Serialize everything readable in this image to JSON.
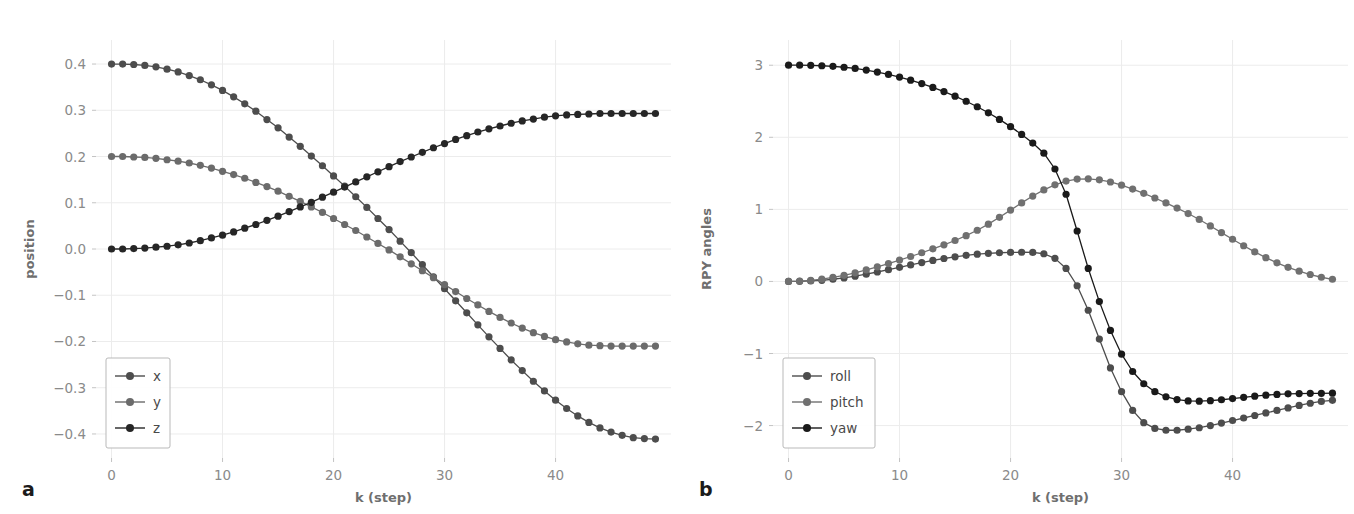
{
  "figure": {
    "panel_a_label": "a",
    "panel_b_label": "b",
    "background": "#ffffff",
    "grid_color": "#ececec"
  },
  "chart_data": [
    {
      "type": "line",
      "panel": "a",
      "title": "",
      "xlabel": "k (step)",
      "ylabel": "position",
      "xlim": [
        -1.4,
        50.4
      ],
      "ylim": [
        -0.452,
        0.452
      ],
      "xticks": [
        0,
        10,
        20,
        30,
        40
      ],
      "yticks": [
        -0.4,
        -0.3,
        -0.2,
        -0.1,
        0.0,
        0.1,
        0.2,
        0.3,
        0.4
      ],
      "xticklabels": [
        "0",
        "10",
        "20",
        "30",
        "40"
      ],
      "yticklabels": [
        "−0.4",
        "−0.3",
        "−0.2",
        "−0.1",
        "0.0",
        "0.1",
        "0.2",
        "0.3",
        "0.4"
      ],
      "grid": true,
      "legend_position": "lower left",
      "markers": "circle",
      "x": [
        0,
        1,
        2,
        3,
        4,
        5,
        6,
        7,
        8,
        9,
        10,
        11,
        12,
        13,
        14,
        15,
        16,
        17,
        18,
        19,
        20,
        21,
        22,
        23,
        24,
        25,
        26,
        27,
        28,
        29,
        30,
        31,
        32,
        33,
        34,
        35,
        36,
        37,
        38,
        39,
        40,
        41,
        42,
        43,
        44,
        45,
        46,
        47,
        48,
        49
      ],
      "series": [
        {
          "name": "x",
          "color": "#4d4d4d",
          "values": [
            0.4,
            0.4,
            0.399,
            0.397,
            0.394,
            0.389,
            0.383,
            0.375,
            0.366,
            0.355,
            0.343,
            0.329,
            0.314,
            0.298,
            0.28,
            0.262,
            0.242,
            0.222,
            0.201,
            0.18,
            0.158,
            0.136,
            0.113,
            0.09,
            0.066,
            0.042,
            0.017,
            -0.008,
            -0.034,
            -0.06,
            -0.086,
            -0.112,
            -0.138,
            -0.164,
            -0.19,
            -0.215,
            -0.24,
            -0.263,
            -0.286,
            -0.307,
            -0.327,
            -0.345,
            -0.361,
            -0.375,
            -0.387,
            -0.396,
            -0.403,
            -0.408,
            -0.41,
            -0.411
          ]
        },
        {
          "name": "y",
          "color": "#6b6b6b",
          "values": [
            0.2,
            0.2,
            0.199,
            0.198,
            0.196,
            0.193,
            0.19,
            0.186,
            0.181,
            0.175,
            0.168,
            0.161,
            0.153,
            0.144,
            0.135,
            0.125,
            0.114,
            0.103,
            0.091,
            0.079,
            0.066,
            0.053,
            0.04,
            0.026,
            0.012,
            -0.002,
            -0.017,
            -0.032,
            -0.047,
            -0.062,
            -0.077,
            -0.092,
            -0.107,
            -0.121,
            -0.135,
            -0.148,
            -0.16,
            -0.171,
            -0.181,
            -0.189,
            -0.196,
            -0.201,
            -0.205,
            -0.208,
            -0.209,
            -0.21,
            -0.21,
            -0.21,
            -0.21,
            -0.21
          ]
        },
        {
          "name": "z",
          "color": "#262626",
          "values": [
            0.0,
            0.0,
            0.001,
            0.002,
            0.004,
            0.006,
            0.009,
            0.013,
            0.018,
            0.024,
            0.03,
            0.037,
            0.045,
            0.053,
            0.062,
            0.071,
            0.081,
            0.091,
            0.101,
            0.112,
            0.123,
            0.134,
            0.145,
            0.156,
            0.167,
            0.178,
            0.189,
            0.199,
            0.209,
            0.219,
            0.228,
            0.237,
            0.245,
            0.253,
            0.26,
            0.266,
            0.272,
            0.277,
            0.281,
            0.285,
            0.288,
            0.29,
            0.291,
            0.292,
            0.293,
            0.293,
            0.293,
            0.293,
            0.293,
            0.293
          ]
        }
      ],
      "legend": [
        "x",
        "y",
        "z"
      ]
    },
    {
      "type": "line",
      "panel": "b",
      "title": "",
      "xlabel": "k (step)",
      "ylabel": "RPY angles",
      "xlim": [
        -1.4,
        50.4
      ],
      "ylim": [
        -2.45,
        3.35
      ],
      "xticks": [
        0,
        10,
        20,
        30,
        40
      ],
      "yticks": [
        -2,
        -1,
        0,
        1,
        2,
        3
      ],
      "xticklabels": [
        "0",
        "10",
        "20",
        "30",
        "40"
      ],
      "yticklabels": [
        "−2",
        "−1",
        "0",
        "1",
        "2",
        "3"
      ],
      "grid": true,
      "legend_position": "lower left",
      "markers": "circle",
      "x": [
        0,
        1,
        2,
        3,
        4,
        5,
        6,
        7,
        8,
        9,
        10,
        11,
        12,
        13,
        14,
        15,
        16,
        17,
        18,
        19,
        20,
        21,
        22,
        23,
        24,
        25,
        26,
        27,
        28,
        29,
        30,
        31,
        32,
        33,
        34,
        35,
        36,
        37,
        38,
        39,
        40,
        41,
        42,
        43,
        44,
        45,
        46,
        47,
        48,
        49
      ],
      "series": [
        {
          "name": "roll",
          "color": "#4d4d4d",
          "values": [
            0.0,
            0.002,
            0.007,
            0.016,
            0.03,
            0.049,
            0.073,
            0.1,
            0.131,
            0.163,
            0.196,
            0.229,
            0.261,
            0.291,
            0.318,
            0.342,
            0.362,
            0.378,
            0.39,
            0.398,
            0.403,
            0.405,
            0.402,
            0.384,
            0.32,
            0.18,
            -0.06,
            -0.4,
            -0.8,
            -1.2,
            -1.53,
            -1.79,
            -1.96,
            -2.04,
            -2.065,
            -2.065,
            -2.05,
            -2.03,
            -2.0,
            -1.965,
            -1.93,
            -1.895,
            -1.86,
            -1.825,
            -1.79,
            -1.755,
            -1.72,
            -1.69,
            -1.665,
            -1.65
          ]
        },
        {
          "name": "pitch",
          "color": "#707070",
          "values": [
            0.0,
            0.004,
            0.014,
            0.031,
            0.055,
            0.085,
            0.12,
            0.159,
            0.202,
            0.248,
            0.296,
            0.346,
            0.398,
            0.452,
            0.508,
            0.568,
            0.635,
            0.71,
            0.795,
            0.89,
            0.99,
            1.09,
            1.185,
            1.27,
            1.34,
            1.392,
            1.42,
            1.424,
            1.41,
            1.38,
            1.336,
            1.282,
            1.222,
            1.158,
            1.09,
            1.018,
            0.942,
            0.86,
            0.77,
            0.678,
            0.585,
            0.495,
            0.41,
            0.33,
            0.258,
            0.196,
            0.142,
            0.096,
            0.058,
            0.03
          ]
        },
        {
          "name": "yaw",
          "color": "#1a1a1a",
          "values": [
            3.0,
            3.0,
            2.998,
            2.993,
            2.985,
            2.972,
            2.955,
            2.933,
            2.905,
            2.872,
            2.835,
            2.792,
            2.745,
            2.692,
            2.634,
            2.57,
            2.5,
            2.424,
            2.34,
            2.248,
            2.148,
            2.04,
            1.92,
            1.78,
            1.56,
            1.21,
            0.7,
            0.18,
            -0.28,
            -0.68,
            -1.01,
            -1.25,
            -1.42,
            -1.53,
            -1.6,
            -1.64,
            -1.658,
            -1.662,
            -1.655,
            -1.642,
            -1.625,
            -1.608,
            -1.592,
            -1.578,
            -1.568,
            -1.56,
            -1.556,
            -1.553,
            -1.552,
            -1.551
          ]
        }
      ],
      "legend": [
        "roll",
        "pitch",
        "yaw"
      ]
    }
  ]
}
